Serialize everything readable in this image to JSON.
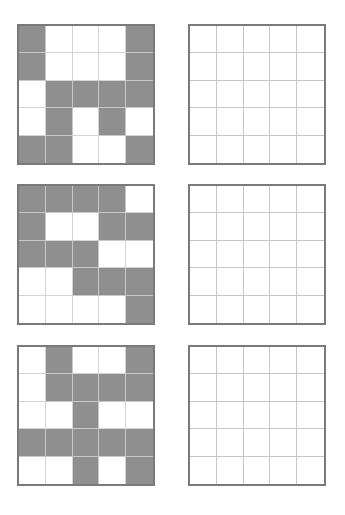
{
  "colors": {
    "filled": "#8f8f8f",
    "empty": "#ffffff",
    "border": "#7a7a7a",
    "gridline": "#d4d4d4"
  },
  "puzzles": [
    {
      "pattern_grid": {
        "rows": [
          [
            1,
            0,
            0,
            0,
            1
          ],
          [
            1,
            0,
            0,
            0,
            1
          ],
          [
            0,
            1,
            1,
            1,
            1
          ],
          [
            0,
            1,
            0,
            1,
            0
          ],
          [
            1,
            1,
            0,
            0,
            1
          ]
        ]
      },
      "answer_grid": {
        "rows": [
          [
            0,
            0,
            0,
            0,
            0
          ],
          [
            0,
            0,
            0,
            0,
            0
          ],
          [
            0,
            0,
            0,
            0,
            0
          ],
          [
            0,
            0,
            0,
            0,
            0
          ],
          [
            0,
            0,
            0,
            0,
            0
          ]
        ]
      }
    },
    {
      "pattern_grid": {
        "rows": [
          [
            1,
            1,
            1,
            1,
            0
          ],
          [
            1,
            0,
            0,
            1,
            1
          ],
          [
            1,
            1,
            1,
            0,
            0
          ],
          [
            0,
            0,
            1,
            1,
            1
          ],
          [
            0,
            0,
            0,
            0,
            1
          ]
        ]
      },
      "answer_grid": {
        "rows": [
          [
            0,
            0,
            0,
            0,
            0
          ],
          [
            0,
            0,
            0,
            0,
            0
          ],
          [
            0,
            0,
            0,
            0,
            0
          ],
          [
            0,
            0,
            0,
            0,
            0
          ],
          [
            0,
            0,
            0,
            0,
            0
          ]
        ]
      }
    },
    {
      "pattern_grid": {
        "rows": [
          [
            0,
            1,
            0,
            0,
            1
          ],
          [
            0,
            1,
            1,
            1,
            1
          ],
          [
            0,
            0,
            1,
            0,
            0
          ],
          [
            1,
            1,
            1,
            1,
            1
          ],
          [
            0,
            0,
            1,
            0,
            1
          ]
        ]
      },
      "answer_grid": {
        "rows": [
          [
            0,
            0,
            0,
            0,
            0
          ],
          [
            0,
            0,
            0,
            0,
            0
          ],
          [
            0,
            0,
            0,
            0,
            0
          ],
          [
            0,
            0,
            0,
            0,
            0
          ],
          [
            0,
            0,
            0,
            0,
            0
          ]
        ]
      }
    }
  ]
}
